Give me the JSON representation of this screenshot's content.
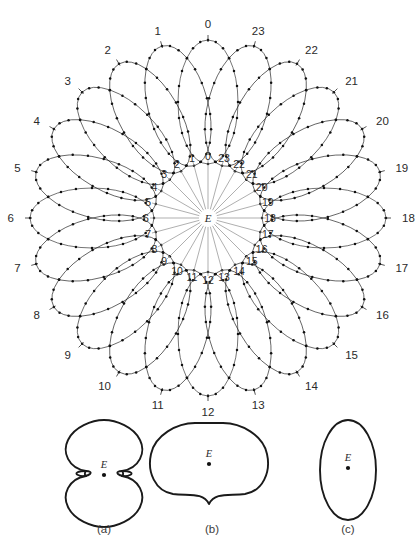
{
  "figure": {
    "center_label": "E",
    "line_color": "#1f1f1f",
    "spoke_color": "#8d8d8d",
    "background": "#ffffff",
    "orbit_count": 24
  },
  "rosette": {
    "center": {
      "x": 208,
      "y": 218
    },
    "outer_radius": 180,
    "inner_radius": 72,
    "ellipse_semi_major": 62,
    "ellipse_semi_minor": 30,
    "ellipse_center_radius": 116,
    "nodes_per_orbit": 24,
    "outer_labels": [
      "0",
      "1",
      "2",
      "3",
      "4",
      "5",
      "6",
      "7",
      "8",
      "9",
      "10",
      "11",
      "12",
      "13",
      "14",
      "15",
      "16",
      "17",
      "18",
      "19",
      "20",
      "21",
      "22",
      "23"
    ],
    "inner_labels": [
      "0",
      "1",
      "2",
      "3",
      "4",
      "5",
      "6",
      "7",
      "8",
      "9",
      "10",
      "11",
      "12",
      "13",
      "14",
      "15",
      "16",
      "17",
      "18",
      "19",
      "20",
      "21",
      "22",
      "23"
    ],
    "outer_label_radius": 194,
    "inner_label_radius": 62,
    "spoke_inner_gap": 9,
    "spoke_outer_radius": 58
  },
  "subfigures": [
    {
      "key": "a",
      "caption": "(a)",
      "center_label": "E",
      "shape": "double-lobed-with-loops",
      "cx": 104,
      "cy": 473,
      "caption_x": 104,
      "caption_y": 531
    },
    {
      "key": "b",
      "caption": "(b)",
      "center_label": "E",
      "shape": "cardioid-cusp",
      "cx": 212,
      "cy": 473,
      "caption_x": 212,
      "caption_y": 531
    },
    {
      "key": "c",
      "caption": "(c)",
      "center_label": "E",
      "shape": "tall-ellipse",
      "cx": 348,
      "cy": 473,
      "caption_x": 348,
      "caption_y": 531
    }
  ],
  "chart_data": {
    "type": "scatter",
    "xlabel": "",
    "ylabel": "",
    "categories": [
      "0",
      "1",
      "2",
      "3",
      "4",
      "5",
      "6",
      "7",
      "8",
      "9",
      "10",
      "11",
      "12",
      "13",
      "14",
      "15",
      "16",
      "17",
      "18",
      "19",
      "20",
      "21",
      "22",
      "23"
    ],
    "values": [
      15,
      15,
      15,
      15,
      15,
      15,
      15,
      15,
      15,
      15,
      15,
      15,
      15,
      15,
      15,
      15,
      15,
      15,
      15,
      15,
      15,
      15,
      15,
      15
    ],
    "series": [
      {
        "name": "orbit orientation angle (deg, measured clockwise from top)",
        "values": [
          0,
          15,
          30,
          45,
          60,
          75,
          90,
          105,
          120,
          135,
          150,
          165,
          180,
          195,
          210,
          225,
          240,
          255,
          270,
          285,
          300,
          315,
          330,
          345
        ]
      }
    ],
    "legend_position": "none",
    "grid": false
  }
}
